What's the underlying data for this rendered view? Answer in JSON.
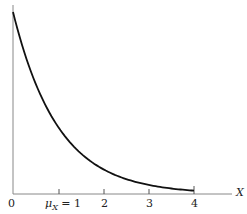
{
  "chart_data": {
    "type": "line",
    "title": "",
    "xlabel": "X",
    "ylabel": "",
    "xlim": [
      0,
      4.5
    ],
    "ylim": [
      0,
      1
    ],
    "grid": false,
    "x_ticks": [
      "0",
      "μX = 1",
      "2",
      "3",
      "4"
    ],
    "series": [
      {
        "name": "f(x) = e^(-x)",
        "x": [
          0,
          0.5,
          1,
          1.5,
          2,
          2.5,
          3,
          3.5,
          4
        ],
        "y": [
          1.0,
          0.607,
          0.368,
          0.223,
          0.135,
          0.082,
          0.05,
          0.03,
          0.018
        ]
      }
    ],
    "annotations": [
      "μX = 1"
    ]
  },
  "labels": {
    "tick0": "0",
    "tick1_mu": "μ",
    "tick1_sub": "X",
    "tick1_rest": " = 1",
    "tick2": "2",
    "tick3": "3",
    "tick4": "4",
    "x_axis": "X"
  }
}
